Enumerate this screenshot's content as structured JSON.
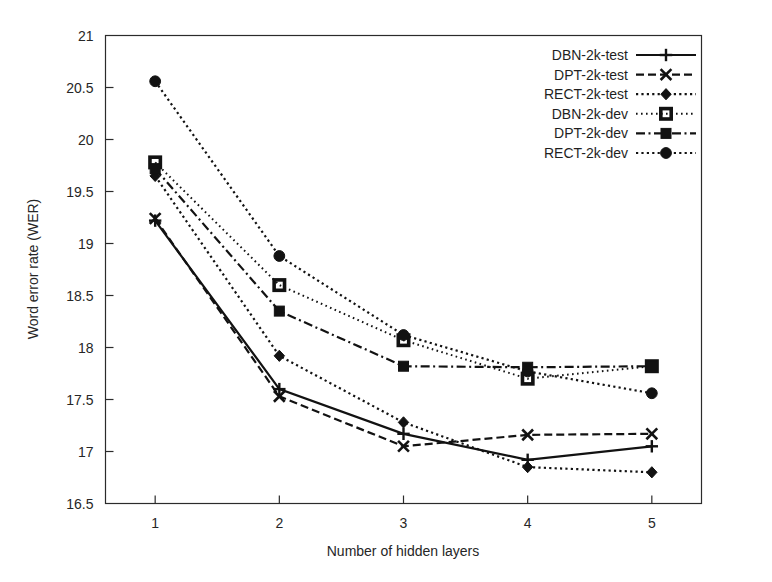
{
  "chart_data": {
    "type": "line",
    "title": "",
    "xlabel": "Number of hidden layers",
    "ylabel": "Word error rate (WER)",
    "x": [
      1,
      2,
      3,
      4,
      5
    ],
    "xlim": [
      0.6,
      5.4
    ],
    "ylim": [
      16.5,
      21
    ],
    "xticks": [
      "1",
      "2",
      "3",
      "4",
      "5"
    ],
    "yticks": [
      "16.5",
      "17",
      "17.5",
      "18",
      "18.5",
      "19",
      "19.5",
      "20",
      "20.5",
      "21"
    ],
    "grid": false,
    "legend_position": "top-right",
    "series": [
      {
        "name": "DBN-2k-test",
        "marker": "plus",
        "dash": "solid",
        "values": [
          19.22,
          17.6,
          17.17,
          16.92,
          17.05
        ]
      },
      {
        "name": "DPT-2k-test",
        "marker": "cross",
        "dash": "dashed",
        "values": [
          19.24,
          17.53,
          17.05,
          17.16,
          17.17
        ]
      },
      {
        "name": "RECT-2k-test",
        "marker": "diamond",
        "dash": "dotted",
        "values": [
          19.65,
          17.92,
          17.28,
          16.85,
          16.8
        ]
      },
      {
        "name": "DBN-2k-dev",
        "marker": "square",
        "dash": "fine-dotted",
        "values": [
          19.78,
          18.6,
          18.07,
          17.7,
          17.82
        ]
      },
      {
        "name": "DPT-2k-dev",
        "marker": "filled-square",
        "dash": "dashdot",
        "values": [
          19.72,
          18.35,
          17.82,
          17.81,
          17.82
        ]
      },
      {
        "name": "RECT-2k-dev",
        "marker": "circle",
        "dash": "dotted",
        "values": [
          20.56,
          18.88,
          18.12,
          17.77,
          17.56
        ]
      }
    ]
  },
  "axes": {
    "x_label": "Number of hidden layers",
    "y_label": "Word error rate (WER)",
    "x_tick_labels": [
      "1",
      "2",
      "3",
      "4",
      "5"
    ],
    "y_tick_labels": [
      "21",
      "20.5",
      "20",
      "19.5",
      "19",
      "18.5",
      "18",
      "17.5",
      "17",
      "16.5"
    ]
  },
  "legend": {
    "entries": [
      "DBN-2k-test",
      "DPT-2k-test",
      "RECT-2k-test",
      "DBN-2k-dev",
      "DPT-2k-dev",
      "RECT-2k-dev"
    ]
  },
  "colors": {
    "ink": "#121212",
    "axis": "#2b2b2b",
    "background": "#ffffff"
  }
}
